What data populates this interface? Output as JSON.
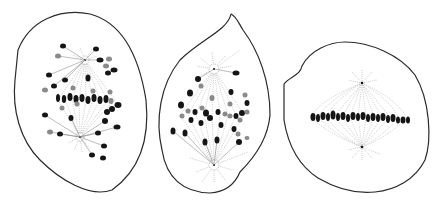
{
  "figure": {
    "style": "black ink line drawing",
    "colors": {
      "ink": "#151515",
      "outline": "#2a2a2a",
      "fiber": "#9a9a9a",
      "background": "#ffffff"
    },
    "cells": [
      {
        "label": "cell-1",
        "stage": "chromosomes migrating along spindle",
        "outline": "M18,50 C30,20 60,8 90,14 C120,22 138,50 146,100 C150,140 140,170 112,190 C90,198 60,180 40,160 C20,140 12,110 15,80 Z",
        "poles": [
          [
            85,
            60
          ],
          [
            80,
            137
          ]
        ],
        "plate_y": 100
      },
      {
        "label": "cell-2",
        "stage": "prometaphase, scattered chromosomes",
        "outline": "M231,14 C228,30 200,40 180,60 C160,85 155,120 162,150 C166,175 180,192 210,193 C225,192 235,184 240,172 C252,160 268,140 270,115 C270,80 258,50 243,30 C238,22 236,16 231,14 Z",
        "poles": [
          [
            214,
            69
          ],
          [
            214,
            165
          ]
        ],
        "plate_y": 115
      },
      {
        "label": "cell-3",
        "stage": "metaphase, chromosomes on equatorial plate",
        "outline": "M284,84 C290,76 300,76 302,66 C310,50 330,42 345,42 C370,42 400,55 415,75 C430,100 432,140 425,160 C415,180 395,190 375,192 C355,194 335,188 318,178 C298,165 288,145 284,120 Z",
        "poles": [
          [
            362,
            83
          ],
          [
            362,
            147
          ]
        ],
        "plate_y": 118
      }
    ]
  }
}
